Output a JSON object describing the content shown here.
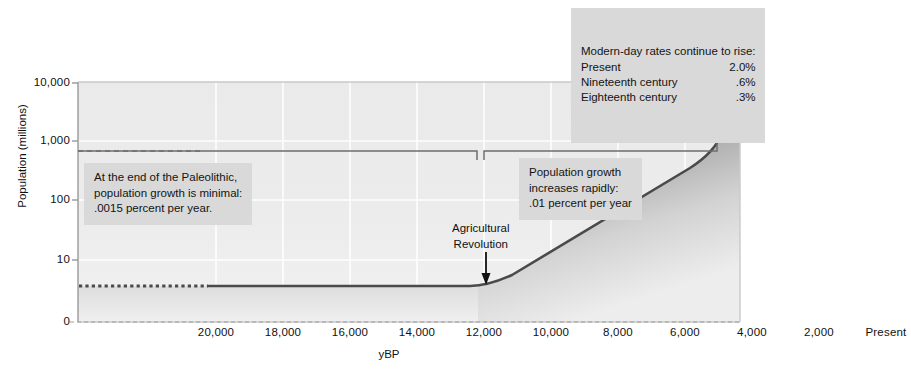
{
  "chart_data": {
    "type": "area",
    "title": "",
    "xlabel": "yBP",
    "ylabel": "Population (millions)",
    "yscale": "log",
    "ylim": [
      0,
      10000
    ],
    "xlim_ybp": [
      21500,
      0
    ],
    "grid": true,
    "legend": "none",
    "ytick_labels": [
      "10,000",
      "1,000",
      "100",
      "10",
      "0"
    ],
    "ytick_values": [
      10000,
      1000,
      100,
      10,
      0
    ],
    "xtick_labels": [
      "20,000",
      "18,000",
      "16,000",
      "14,000",
      "12,000",
      "10,000",
      "8,000",
      "6,000",
      "4,000",
      "2,000",
      "Present"
    ],
    "xtick_values": [
      20000,
      18000,
      16000,
      14000,
      12000,
      10000,
      8000,
      6000,
      4000,
      2000,
      0
    ],
    "series": [
      {
        "name": "World population",
        "points_ybp_millions": [
          [
            21500,
            5
          ],
          [
            20000,
            5
          ],
          [
            18000,
            5
          ],
          [
            16000,
            5
          ],
          [
            14000,
            5
          ],
          [
            12000,
            5
          ],
          [
            10500,
            5
          ],
          [
            10000,
            5.2
          ],
          [
            9500,
            6
          ],
          [
            8000,
            11
          ],
          [
            6000,
            27
          ],
          [
            4000,
            62
          ],
          [
            3000,
            95
          ],
          [
            2000,
            170
          ],
          [
            1000,
            300
          ],
          [
            500,
            460
          ],
          [
            300,
            600
          ],
          [
            200,
            800
          ],
          [
            120,
            1200
          ],
          [
            60,
            2000
          ],
          [
            30,
            3700
          ],
          [
            10,
            6000
          ],
          [
            0,
            9000
          ]
        ]
      }
    ],
    "annotations": {
      "modern_rates": {
        "heading": "Modern-day rates continue to rise:",
        "rows": [
          {
            "label": "Present",
            "value": "2.0%"
          },
          {
            "label": "Nineteenth century",
            "value": ".6%"
          },
          {
            "label": "Eighteenth century",
            "value": ".3%"
          }
        ]
      },
      "paleolithic": "At the end of the Paleolithic,\npopulation growth is minimal:\n.0015 percent per year.",
      "rapid_growth": "Population growth\nincreases rapidly:\n.01 percent per year",
      "agricultural_revolution": "Agricultural\nRevolution"
    },
    "colors": {
      "curve": "#4a4a4a",
      "fill_dark": "#6f6f6f",
      "fill_light": "#f2f2f2",
      "plot_background": "#ebebeb",
      "callout_background": "#d9d9d9",
      "gridline": "#ffffff",
      "axis": "#9a9a9a",
      "text": "#141414"
    }
  }
}
